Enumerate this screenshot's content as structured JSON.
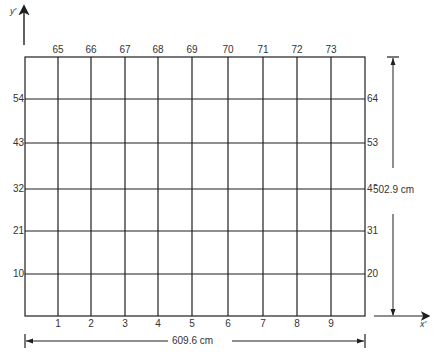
{
  "diagram": {
    "axes": {
      "y_label": "y′",
      "x_label": "x′"
    },
    "columns": {
      "bottom_labels": [
        "1",
        "2",
        "3",
        "4",
        "5",
        "6",
        "7",
        "8",
        "9"
      ],
      "top_labels": [
        "65",
        "66",
        "67",
        "68",
        "69",
        "70",
        "71",
        "72",
        "73"
      ],
      "x_positions": [
        58,
        91,
        125,
        158,
        192,
        228,
        263,
        297,
        331
      ]
    },
    "rows": {
      "left_labels": [
        "54",
        "43",
        "32",
        "21",
        "10"
      ],
      "right_labels": [
        "64",
        "53",
        "42",
        "31",
        "20"
      ],
      "y_positions": [
        99,
        143,
        189,
        231,
        274
      ]
    },
    "frame": {
      "left": 25,
      "top": 57,
      "right": 365,
      "bottom": 316
    },
    "dimensions": {
      "width_label": "609.6 cm",
      "height_label": "502.9 cm"
    },
    "colors": {
      "line": "#1f1f1f",
      "text": "#333333"
    }
  }
}
